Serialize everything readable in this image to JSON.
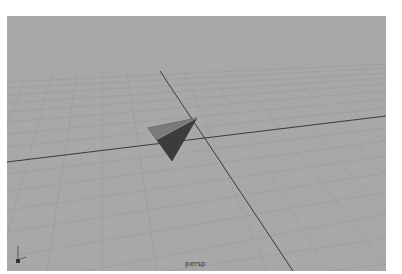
{
  "viewport": {
    "camera_label": "persp",
    "background_color": "#a8a8a8",
    "grid_color": "#999999",
    "axis_line_color": "#3a3a3a",
    "object": "cone-primitive"
  },
  "axis_gizmo": {
    "y_label": "Y",
    "z_label": "z"
  }
}
